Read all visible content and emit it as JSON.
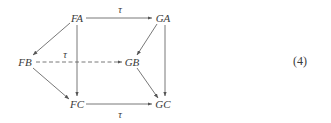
{
  "diagram": {
    "type": "commutative-cube",
    "nodes": [
      {
        "id": "FA",
        "label": "FA",
        "x": 77,
        "y": 18
      },
      {
        "id": "GA",
        "label": "GA",
        "x": 162,
        "y": 18
      },
      {
        "id": "FB",
        "label": "FB",
        "x": 26,
        "y": 62
      },
      {
        "id": "GB",
        "label": "GB",
        "x": 132,
        "y": 62
      },
      {
        "id": "FC",
        "label": "FC",
        "x": 77,
        "y": 104
      },
      {
        "id": "GC",
        "label": "GC",
        "x": 162,
        "y": 104
      }
    ],
    "edges": [
      {
        "from": "FA",
        "to": "GA",
        "label": "τ",
        "style": "solid"
      },
      {
        "from": "FA",
        "to": "FB",
        "label": "",
        "style": "solid"
      },
      {
        "from": "FA",
        "to": "FC",
        "label": "",
        "style": "solid"
      },
      {
        "from": "GA",
        "to": "GB",
        "label": "",
        "style": "solid"
      },
      {
        "from": "GA",
        "to": "GC",
        "label": "",
        "style": "solid"
      },
      {
        "from": "FB",
        "to": "GB",
        "label": "τ",
        "style": "dashed"
      },
      {
        "from": "FB",
        "to": "FC",
        "label": "",
        "style": "solid"
      },
      {
        "from": "GB",
        "to": "GC",
        "label": "",
        "style": "solid"
      },
      {
        "from": "FC",
        "to": "GC",
        "label": "τ",
        "style": "solid"
      }
    ],
    "edge_labels": {
      "top": "τ",
      "middle": "τ",
      "bottom": "τ"
    },
    "equation_number": "(4)",
    "colors": {
      "line": "#555555",
      "text": "#3a3a3a",
      "background": "#ffffff"
    }
  }
}
